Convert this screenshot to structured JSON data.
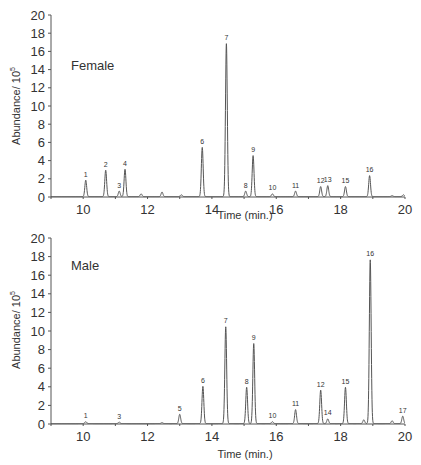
{
  "chart_data": [
    {
      "type": "line",
      "title": "Female",
      "xlabel": "Time (min.)",
      "ylabel": "Abundance/ 10^5",
      "ylabel_base": "Abundance/ 10",
      "ylabel_exp": "5",
      "xlim": [
        9,
        20
      ],
      "ylim": [
        0,
        20
      ],
      "xticks": [
        10,
        12,
        14,
        16,
        18,
        20
      ],
      "yticks": [
        0,
        2,
        4,
        6,
        8,
        10,
        12,
        14,
        16,
        18,
        20
      ],
      "grid": false,
      "peaks": [
        {
          "label": "1",
          "x": 10.08,
          "y": 1.8
        },
        {
          "label": "2",
          "x": 10.7,
          "y": 2.9
        },
        {
          "label": "3",
          "x": 11.12,
          "y": 0.6
        },
        {
          "label": "4",
          "x": 11.3,
          "y": 3.0
        },
        {
          "label": "",
          "x": 11.8,
          "y": 0.3
        },
        {
          "label": "",
          "x": 12.45,
          "y": 0.5
        },
        {
          "label": "",
          "x": 13.05,
          "y": 0.2
        },
        {
          "label": "6",
          "x": 13.7,
          "y": 5.4
        },
        {
          "label": "7",
          "x": 14.45,
          "y": 16.8
        },
        {
          "label": "8",
          "x": 15.05,
          "y": 0.6
        },
        {
          "label": "9",
          "x": 15.28,
          "y": 4.5
        },
        {
          "label": "10",
          "x": 15.88,
          "y": 0.3
        },
        {
          "label": "11",
          "x": 16.6,
          "y": 0.6
        },
        {
          "label": "12",
          "x": 17.38,
          "y": 1.1
        },
        {
          "label": "13",
          "x": 17.6,
          "y": 1.2
        },
        {
          "label": "15",
          "x": 18.15,
          "y": 1.1
        },
        {
          "label": "16",
          "x": 18.9,
          "y": 2.3
        },
        {
          "label": "",
          "x": 19.6,
          "y": 0.1
        },
        {
          "label": "",
          "x": 19.95,
          "y": 0.2
        }
      ]
    },
    {
      "type": "line",
      "title": "Male",
      "xlabel": "Time (min.)",
      "ylabel": "Abundance/ 10^5",
      "ylabel_base": "Abundance/ 10",
      "ylabel_exp": "5",
      "xlim": [
        9,
        20
      ],
      "ylim": [
        0,
        20
      ],
      "xticks": [
        10,
        12,
        14,
        16,
        18,
        20
      ],
      "yticks": [
        0,
        2,
        4,
        6,
        8,
        10,
        12,
        14,
        16,
        18,
        20
      ],
      "grid": false,
      "peaks": [
        {
          "label": "1",
          "x": 10.08,
          "y": 0.2
        },
        {
          "label": "3",
          "x": 11.12,
          "y": 0.15
        },
        {
          "label": "",
          "x": 12.45,
          "y": 0.1
        },
        {
          "label": "5",
          "x": 13.0,
          "y": 1.0
        },
        {
          "label": "6",
          "x": 13.72,
          "y": 4.0
        },
        {
          "label": "7",
          "x": 14.43,
          "y": 10.4
        },
        {
          "label": "8",
          "x": 15.08,
          "y": 3.9
        },
        {
          "label": "9",
          "x": 15.3,
          "y": 8.6
        },
        {
          "label": "10",
          "x": 15.88,
          "y": 0.2
        },
        {
          "label": "11",
          "x": 16.6,
          "y": 1.5
        },
        {
          "label": "12",
          "x": 17.38,
          "y": 3.6
        },
        {
          "label": "14",
          "x": 17.6,
          "y": 0.5
        },
        {
          "label": "15",
          "x": 18.15,
          "y": 3.9
        },
        {
          "label": "",
          "x": 18.72,
          "y": 0.4
        },
        {
          "label": "16",
          "x": 18.92,
          "y": 17.6
        },
        {
          "label": "",
          "x": 19.6,
          "y": 0.3
        },
        {
          "label": "17",
          "x": 19.93,
          "y": 0.8
        }
      ]
    }
  ],
  "panels": [
    {
      "title": "Female",
      "xlabel": "Time (min.)",
      "ylabel_base": "Abundance/ 10",
      "ylabel_exp": "5"
    },
    {
      "title": "Male",
      "xlabel": "Time (min.)",
      "ylabel_base": "Abundance/ 10",
      "ylabel_exp": "5"
    }
  ],
  "colors": {
    "trace": "#555555",
    "axis": "#555555",
    "text": "#333333",
    "background": "#ffffff"
  }
}
